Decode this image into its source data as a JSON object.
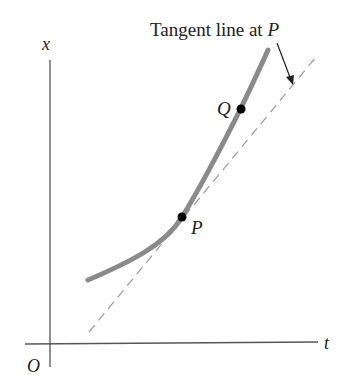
{
  "diagram": {
    "title": "Tangent line at P",
    "caption_prefix": "Tangent line at ",
    "caption_point": "P",
    "axes": {
      "vertical_label": "x",
      "horizontal_label": "t",
      "origin_label": "O"
    },
    "points": [
      {
        "label": "P",
        "description": "point on curve where tangent is drawn"
      },
      {
        "label": "Q",
        "description": "second point on curve"
      }
    ],
    "colors": {
      "curve": "#8a8a8a",
      "tangent": "#9a9a9a",
      "axes": "#555555",
      "points": "#000000",
      "text": "#222222"
    }
  }
}
